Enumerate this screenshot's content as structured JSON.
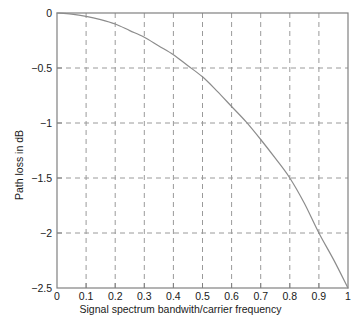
{
  "chart_data": {
    "type": "line",
    "title": "",
    "xlabel": "Signal spectrum bandwith/carrier frequency",
    "ylabel": "Path loss in dB",
    "xlim": [
      0,
      1
    ],
    "ylim": [
      -2.5,
      0
    ],
    "grid": true,
    "legend": null,
    "xticks": [
      0,
      0.1,
      0.2,
      0.3,
      0.4,
      0.5,
      0.6,
      0.7,
      0.8,
      0.9,
      1
    ],
    "xticklabels": [
      "0",
      "0.1",
      "0.2",
      "0.3",
      "0.4",
      "0.5",
      "0.6",
      "0.7",
      "0.8",
      "0.9",
      "1"
    ],
    "yticks": [
      0,
      -0.5,
      -1,
      -1.5,
      -2,
      -2.5
    ],
    "yticklabels": [
      "0",
      "−0.5",
      "−1",
      "−1.5",
      "−2",
      "−2.5"
    ],
    "series": [
      {
        "name": "Path loss",
        "color": "#8c8c8c",
        "x": [
          0,
          0.05,
          0.1,
          0.15,
          0.2,
          0.25,
          0.3,
          0.35,
          0.4,
          0.45,
          0.5,
          0.55,
          0.6,
          0.65,
          0.7,
          0.75,
          0.8,
          0.85,
          0.9,
          0.95,
          1
        ],
        "y": [
          0,
          -0.01,
          -0.03,
          -0.06,
          -0.1,
          -0.16,
          -0.22,
          -0.3,
          -0.38,
          -0.48,
          -0.58,
          -0.71,
          -0.85,
          -0.99,
          -1.15,
          -1.32,
          -1.5,
          -1.73,
          -2.0,
          -2.24,
          -2.5
        ]
      }
    ]
  },
  "axes": {
    "x_title": "Signal spectrum bandwith/carrier frequency",
    "y_title": "Path loss in dB",
    "x_labels": [
      "0",
      "0.1",
      "0.2",
      "0.3",
      "0.4",
      "0.5",
      "0.6",
      "0.7",
      "0.8",
      "0.9",
      "1"
    ],
    "y_labels": [
      "0",
      "−0.5",
      "−1",
      "−1.5",
      "−2",
      "−2.5"
    ]
  },
  "colors": {
    "curve": "#8c8c8c",
    "grid": "#9a9a9a",
    "axis": "#808080",
    "background": "#ffffff",
    "text": "#1a1a1a"
  }
}
